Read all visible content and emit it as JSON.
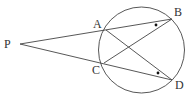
{
  "diagram": {
    "type": "geometry",
    "circle": {
      "cx": 141.5,
      "cy": 50,
      "r": 43
    },
    "points": {
      "P": {
        "label": "P",
        "x": 20,
        "y": 44,
        "lx": 4,
        "ly": 48
      },
      "A": {
        "label": "A",
        "x": 106,
        "y": 30,
        "lx": 93,
        "ly": 28
      },
      "B": {
        "label": "B",
        "x": 172,
        "y": 19,
        "lx": 174,
        "ly": 16
      },
      "C": {
        "label": "C",
        "x": 104,
        "y": 63,
        "lx": 92,
        "ly": 74
      },
      "D": {
        "label": "D",
        "x": 172,
        "y": 80,
        "lx": 175,
        "ly": 89
      }
    },
    "segments": [
      {
        "from": "P",
        "to": "B"
      },
      {
        "from": "P",
        "to": "D"
      },
      {
        "from": "A",
        "to": "D"
      },
      {
        "from": "C",
        "to": "B"
      }
    ],
    "angle_marks": [
      {
        "at": "B",
        "style": "dot",
        "x": 156,
        "y": 25
      },
      {
        "at": "D",
        "style": "dot",
        "x": 158,
        "y": 73
      }
    ],
    "colors": {
      "stroke": "#444444",
      "text": "#333333",
      "background": "#ffffff"
    }
  }
}
